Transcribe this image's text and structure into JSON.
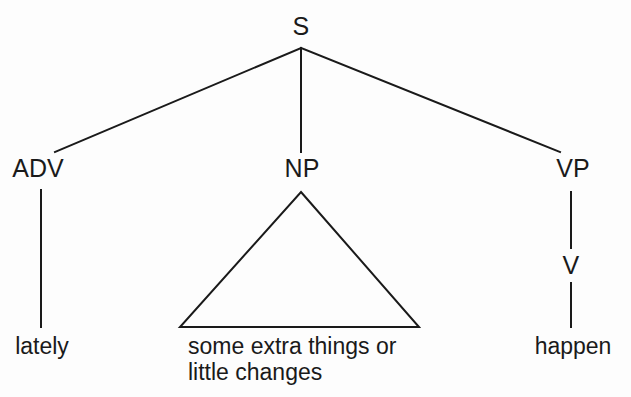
{
  "diagram": {
    "type": "constituency-syntax-tree",
    "sentence": "lately some extra things or little changes happen",
    "ink_color": "#1a1a1a",
    "background_color": "#ffffff",
    "line_width": 2,
    "nodes": {
      "root": "S",
      "adv": "ADV",
      "np": "NP",
      "vp": "VP",
      "v": "V"
    },
    "leaves": {
      "adv_word": "lately",
      "np_phrase_line1": "some extra things or",
      "np_phrase_line2": "little changes",
      "v_word": "happen"
    }
  }
}
